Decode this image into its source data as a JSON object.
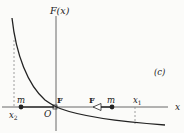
{
  "figure": {
    "panel_label": "(c)",
    "y_axis_label": "F(x)",
    "x_axis_label": "x",
    "origin_label": "O",
    "points": [
      {
        "label": "x₂",
        "main": "x",
        "sub": "2"
      },
      {
        "label": "x₁",
        "main": "x",
        "sub": "1"
      }
    ],
    "masses": [
      {
        "label": "m",
        "position": "at x2",
        "force_label": "F",
        "force_direction": "right"
      },
      {
        "label": "m",
        "position": "between O and x1",
        "force_label": "F",
        "force_direction": "left"
      }
    ],
    "curve": "F(x) decreasing, steep positive at left, crossing zero at O, negative and flattening toward right",
    "colors": {
      "ink": "#222222",
      "background": "#fbfbf9",
      "dashed": "#888888"
    }
  }
}
